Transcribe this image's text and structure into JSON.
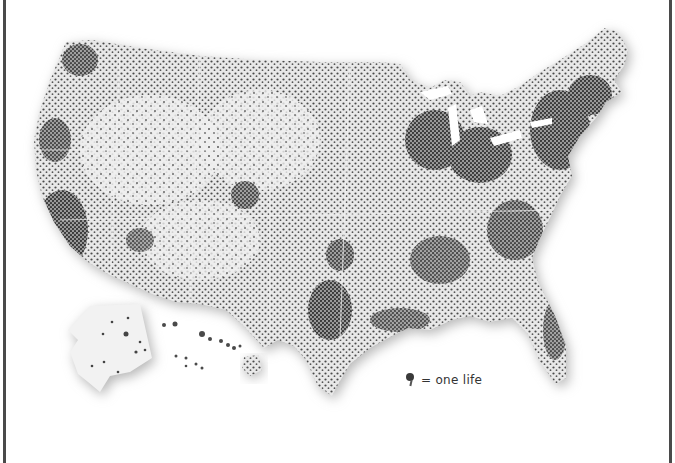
{
  "map": {
    "type": "dot-density",
    "subject": "United States",
    "regions": [
      "contiguous-us",
      "alaska",
      "hawaii"
    ],
    "dot_color": "#3a3a3a",
    "land_color": "#e6e6e6",
    "shadow_color": "#bcbcbc"
  },
  "legend": {
    "icon": "pin-icon",
    "label": "= one life"
  },
  "frame": {
    "border_color": "#4a4a4a"
  }
}
